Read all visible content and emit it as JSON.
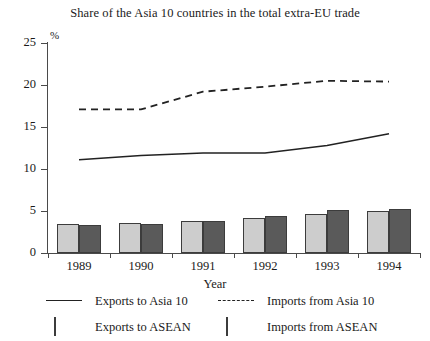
{
  "chart_data": {
    "type": "bar",
    "title": "Share of the Asia 10 countries in the total extra-EU trade",
    "xlabel": "Year",
    "ylabel": "",
    "unit_label": "%",
    "categories": [
      "1989",
      "1990",
      "1991",
      "1992",
      "1993",
      "1994"
    ],
    "ylim": [
      0,
      25
    ],
    "yticks": [
      0,
      5,
      10,
      15,
      20,
      25
    ],
    "ytick_labels": [
      "0",
      "5",
      "10",
      "15",
      "20",
      "25"
    ],
    "grid": false,
    "legend_position": "below",
    "series": [
      {
        "name": "Exports to Asia 10",
        "type": "line",
        "style": "solid",
        "color": "#222222",
        "values": [
          11.1,
          11.6,
          11.9,
          11.9,
          12.8,
          14.2
        ]
      },
      {
        "name": "Imports from Asia 10",
        "type": "line",
        "style": "dashed",
        "color": "#222222",
        "values": [
          17.1,
          17.1,
          19.2,
          19.8,
          20.5,
          20.4
        ]
      },
      {
        "name": "Exports to ASEAN",
        "type": "bar",
        "color": "#cdcdcd",
        "values": [
          3.4,
          3.6,
          3.8,
          4.2,
          4.7,
          5.0
        ]
      },
      {
        "name": "Imports from ASEAN",
        "type": "bar",
        "color": "#5a5a5a",
        "values": [
          3.3,
          3.4,
          3.8,
          4.4,
          5.1,
          5.3
        ]
      }
    ]
  },
  "legend": {
    "entries": [
      {
        "label": "Exports to Asia 10",
        "mark": "solid-line-marker"
      },
      {
        "label": "Imports from Asia 10",
        "mark": "dashed-line-marker"
      },
      {
        "label": "Exports to ASEAN",
        "mark": "light-gray-swatch"
      },
      {
        "label": "Imports from ASEAN",
        "mark": "dark-gray-swatch"
      }
    ]
  },
  "colors": {
    "bar_light": "#cdcdcd",
    "bar_dark": "#5a5a5a",
    "line": "#222222",
    "axis": "#4a4a4a",
    "background": "#ffffff"
  }
}
